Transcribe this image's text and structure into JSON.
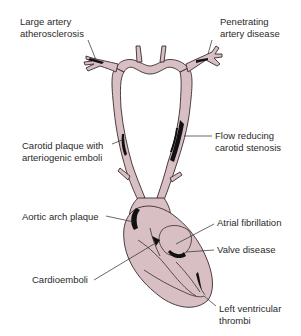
{
  "diagram": {
    "colors": {
      "vessel_fill": "#d8bfc4",
      "outline": "#3a2a2e",
      "plaque": "#111111",
      "text": "#2a2a2a",
      "background": "#ffffff"
    },
    "labels": {
      "large_artery": {
        "line1": "Large artery",
        "line2": "atherosclerosis"
      },
      "penetrating": {
        "line1": "Penetrating",
        "line2": "artery disease"
      },
      "carotid_plaque": {
        "line1": "Carotid plaque with",
        "line2": "arteriogenic emboli"
      },
      "flow_reducing": {
        "line1": "Flow reducing",
        "line2": "carotid stenosis"
      },
      "aortic_arch": {
        "line1": "Aortic arch plaque"
      },
      "atrial_fib": {
        "line1": "Atrial fibrillation"
      },
      "valve": {
        "line1": "Valve disease"
      },
      "cardioemboli": {
        "line1": "Cardioemboli"
      },
      "left_ventricular": {
        "line1": "Left ventricular",
        "line2": "thrombi"
      }
    }
  }
}
